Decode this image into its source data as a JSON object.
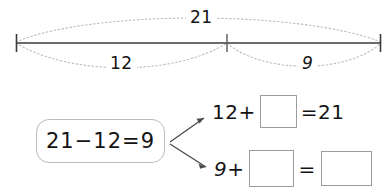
{
  "worksheet": {
    "type": "part-part-whole-number-line",
    "number_line": {
      "total_label": "21",
      "part_left_label": "12",
      "part_right_label": "9",
      "tick_count": 3,
      "line_color": "#3b3b3b",
      "arc_color": "#b4b4b4"
    },
    "fact_family_box": {
      "equation": "21−12=9",
      "border_color": "#b9bcbe"
    },
    "arrows": {
      "color": "#4a4a4a",
      "count": 2
    },
    "equations": [
      {
        "id": "equation-top",
        "addend": "12",
        "plus": "+",
        "blank_1": "",
        "equals": "=",
        "sum": "21"
      },
      {
        "id": "equation-bottom",
        "addend": "9",
        "plus": "+",
        "blank_1": "",
        "equals": "=",
        "blank_2": ""
      }
    ]
  }
}
